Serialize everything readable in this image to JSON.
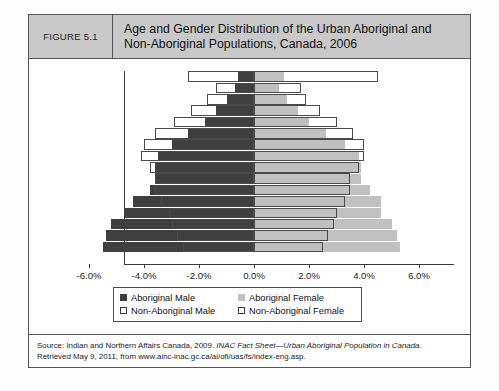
{
  "figure": {
    "number_label": "FIGURE 5.1",
    "title_line1": "Age and Gender Distribution of the Urban Aboriginal and",
    "title_line2": "Non-Aboriginal Populations, Canada, 2006"
  },
  "legend": {
    "aboriginal_male": "Aboriginal Male",
    "aboriginal_female": "Aboriginal Female",
    "non_aboriginal_male": "Non-Aboriginal Male",
    "non_aboriginal_female": "Non-Aboriginal Female"
  },
  "source": {
    "line1_a": "Source: Indian and Northern Affairs Canada, 2009. ",
    "line1_italic": "INAC Fact Sheet—Urban Aboriginal Population in Canada",
    "line1_b": ".",
    "line2": "Retrieved May 9, 2011, from www.ainc-inac.gc.ca/ai/ofi/uas/fs/index-eng.asp."
  },
  "colors": {
    "aboriginal_male": "#3f3f3f",
    "aboriginal_female": "#c0c0c0",
    "non_aboriginal_outline": "#4a4a4a",
    "header_band": "#c9c9c9",
    "frame": "#555555"
  },
  "chart_data": {
    "type": "bar",
    "subtype": "population-pyramid",
    "title": "Age and Gender Distribution of the Urban Aboriginal and Non-Aboriginal Populations, Canada, 2006",
    "xlabel": "",
    "ylabel": "",
    "xlim": [
      -6.0,
      6.0
    ],
    "xticks": [
      -6.0,
      -4.0,
      -2.0,
      0.0,
      2.0,
      4.0,
      6.0
    ],
    "xtick_labels": [
      "-6.0%",
      "-4.0%",
      "-2.0%",
      "0.0%",
      "2.0%",
      "4.0%",
      "6.0%"
    ],
    "grid": false,
    "legend_position": "bottom",
    "note": "Male values plotted to the left of zero (negative), female values to the right (positive); percentages are share of total population.",
    "categories": [
      "0-4",
      "5-9",
      "10-14",
      "15-19",
      "20-24",
      "25-29",
      "30-34",
      "35-39",
      "40-44",
      "45-49",
      "50-54",
      "55-59",
      "60-64",
      "65-69",
      "70-74",
      "75+"
    ],
    "series": [
      {
        "name": "Aboriginal Male",
        "side": "left",
        "color": "#3f3f3f",
        "values": [
          -5.5,
          -5.4,
          -5.2,
          -4.7,
          -4.4,
          -3.8,
          -3.6,
          -3.6,
          -3.5,
          -3.0,
          -2.4,
          -1.8,
          -1.4,
          -1.0,
          -0.7,
          -0.6
        ]
      },
      {
        "name": "Aboriginal Female",
        "side": "right",
        "color": "#c0c0c0",
        "values": [
          5.3,
          5.2,
          5.0,
          4.6,
          4.6,
          4.2,
          3.9,
          3.9,
          3.8,
          3.3,
          2.6,
          2.0,
          1.6,
          1.2,
          0.9,
          1.1
        ]
      },
      {
        "name": "Non-Aboriginal Male",
        "side": "left",
        "color": "#ffffff",
        "values": [
          -2.6,
          -2.8,
          -3.0,
          -3.1,
          -3.4,
          -3.6,
          -3.6,
          -3.8,
          -4.1,
          -4.0,
          -3.6,
          -2.9,
          -2.3,
          -1.7,
          -1.4,
          -2.4
        ]
      },
      {
        "name": "Non-Aboriginal Female",
        "side": "right",
        "color": "#ffffff",
        "values": [
          2.5,
          2.7,
          2.9,
          3.0,
          3.3,
          3.5,
          3.5,
          3.8,
          4.0,
          4.0,
          3.6,
          3.0,
          2.4,
          1.9,
          1.7,
          4.5
        ]
      }
    ]
  }
}
